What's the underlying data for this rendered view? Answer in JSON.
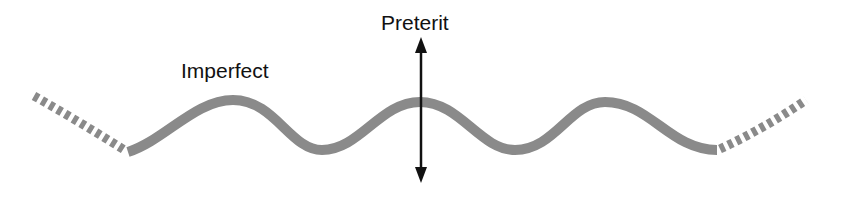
{
  "diagram": {
    "labels": {
      "imperfect": "Imperfect",
      "preterit": "Preterit"
    },
    "colors": {
      "wave": "#8a8a8a",
      "arrow": "#111111",
      "text": "#111111",
      "background": "#ffffff"
    },
    "wave": {
      "style": "solid gray sinusoid with dashed continuations at both ends",
      "peaks": 3,
      "troughs": 2
    },
    "arrow": {
      "direction": "bidirectional vertical",
      "position": "crossing middle peak of wave"
    }
  }
}
